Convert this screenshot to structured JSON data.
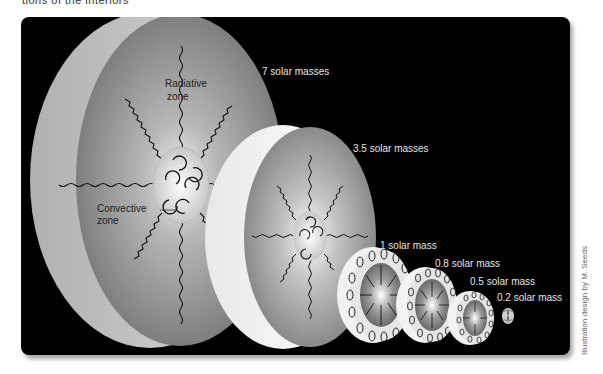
{
  "caption_fragment": "tions of the interiors",
  "figure": {
    "zone_labels": {
      "radiative": "Radiative",
      "radiative_line2": "zone",
      "convective": "Convective",
      "convective_line2": "zone"
    },
    "stars": [
      {
        "label": "7 solar masses"
      },
      {
        "label": "3.5 solar masses"
      },
      {
        "label": "1 solar mass"
      },
      {
        "label": "0.8 solar mass"
      },
      {
        "label": "0.5 solar mass"
      },
      {
        "label": "0.2 solar mass"
      }
    ],
    "credit": "Illustration design by M. Seeds"
  },
  "colors": {
    "background": "#000000",
    "page": "#ffffff",
    "label_text": "#e6e6e6",
    "star_face": "#8a8a8a",
    "star_shell": "#c8c8c8"
  }
}
